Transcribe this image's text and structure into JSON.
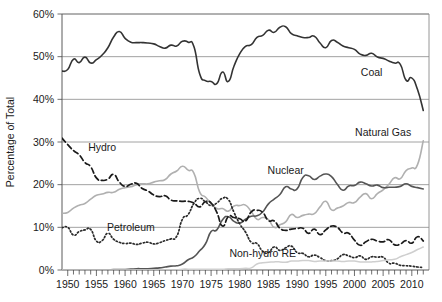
{
  "chart_data": {
    "type": "line",
    "title": "",
    "xlabel": "",
    "ylabel": "Percentage of Total",
    "xlim": [
      1949,
      2013
    ],
    "ylim": [
      0,
      60
    ],
    "grid": true,
    "legend_position": "inline-annotations",
    "ytick_labels": [
      "0%",
      "10%",
      "20%",
      "30%",
      "40%",
      "50%",
      "60%"
    ],
    "ytick_values": [
      0,
      10,
      20,
      30,
      40,
      50,
      60
    ],
    "xtick_labels": [
      "1950",
      "1955",
      "1960",
      "1965",
      "1970",
      "1975",
      "1980",
      "1985",
      "1990",
      "1995",
      "2000",
      "2005",
      "2010"
    ],
    "xtick_values": [
      1950,
      1955,
      1960,
      1965,
      1970,
      1975,
      1980,
      1985,
      1990,
      1995,
      2000,
      2005,
      2010
    ],
    "minor_tick_interval": 1,
    "x": [
      1949,
      1950,
      1951,
      1952,
      1953,
      1954,
      1955,
      1956,
      1957,
      1958,
      1959,
      1960,
      1961,
      1962,
      1963,
      1964,
      1965,
      1966,
      1967,
      1968,
      1969,
      1970,
      1971,
      1972,
      1973,
      1974,
      1975,
      1976,
      1977,
      1978,
      1979,
      1980,
      1981,
      1982,
      1983,
      1984,
      1985,
      1986,
      1987,
      1988,
      1989,
      1990,
      1991,
      1992,
      1993,
      1994,
      1995,
      1996,
      1997,
      1998,
      1999,
      2000,
      2001,
      2002,
      2003,
      2004,
      2005,
      2006,
      2007,
      2008,
      2009,
      2010,
      2011,
      2012
    ],
    "series": [
      {
        "name": "Coal",
        "style": "solid",
        "color": "#333333",
        "width": 1.6,
        "label_x": 2003,
        "label_y": 45.5,
        "values": [
          46.6,
          47.0,
          49.4,
          48.6,
          49.9,
          48.5,
          49.3,
          50.4,
          52.1,
          54.6,
          55.9,
          54.3,
          53.4,
          53.3,
          53.3,
          53.2,
          53.0,
          52.4,
          52.0,
          52.7,
          52.5,
          53.6,
          53.4,
          52.4,
          46.0,
          44.4,
          44.2,
          43.7,
          46.4,
          44.2,
          47.8,
          50.7,
          52.4,
          52.8,
          54.5,
          55.0,
          56.2,
          55.7,
          56.9,
          57.0,
          55.4,
          54.9,
          54.5,
          54.5,
          54.8,
          53.2,
          52.1,
          53.8,
          53.4,
          52.5,
          52.1,
          51.7,
          50.6,
          50.3,
          50.8,
          49.9,
          49.6,
          49.0,
          48.5,
          48.2,
          44.5,
          45.0,
          42.3,
          37.4
        ]
      },
      {
        "name": "Natural Gas",
        "style": "solid",
        "color": "#b0b0b0",
        "width": 1.6,
        "label_x": 2005,
        "label_y": 31.5,
        "values": [
          13.3,
          13.5,
          14.5,
          15.2,
          15.6,
          16.6,
          17.5,
          17.8,
          18.2,
          18.2,
          18.9,
          19.3,
          19.5,
          20.0,
          20.2,
          20.2,
          20.6,
          20.9,
          21.2,
          22.5,
          23.2,
          24.3,
          23.4,
          22.7,
          18.3,
          17.1,
          15.6,
          14.4,
          14.4,
          13.8,
          15.0,
          15.1,
          15.2,
          13.7,
          11.9,
          12.3,
          11.8,
          10.0,
          10.6,
          11.3,
          13.0,
          12.3,
          12.8,
          13.1,
          13.2,
          14.8,
          16.1,
          14.1,
          14.5,
          15.0,
          15.8,
          15.8,
          17.1,
          17.9,
          16.7,
          17.9,
          18.8,
          20.1,
          21.6,
          21.4,
          23.3,
          23.9,
          24.7,
          30.3
        ]
      },
      {
        "name": "Nuclear",
        "style": "solid",
        "color": "#555555",
        "width": 1.6,
        "label_x": 1988,
        "label_y": 22.5,
        "values": [
          0.0,
          0.0,
          0.0,
          0.0,
          0.0,
          0.0,
          0.0,
          0.0,
          0.0,
          0.1,
          0.1,
          0.1,
          0.2,
          0.3,
          0.3,
          0.3,
          0.4,
          0.5,
          0.7,
          0.9,
          1.0,
          1.4,
          2.4,
          3.1,
          4.5,
          6.1,
          9.0,
          9.4,
          11.8,
          12.5,
          11.4,
          11.0,
          11.9,
          12.6,
          12.7,
          13.6,
          15.5,
          16.6,
          17.7,
          19.5,
          19.0,
          19.0,
          21.7,
          22.1,
          21.2,
          22.0,
          22.5,
          21.9,
          20.1,
          18.7,
          19.7,
          19.8,
          20.6,
          20.2,
          19.7,
          19.9,
          19.3,
          19.4,
          19.4,
          19.6,
          20.2,
          19.6,
          19.3,
          19.0
        ]
      },
      {
        "name": "Hydro",
        "style": "dashed",
        "color": "#1a1a1a",
        "width": 1.7,
        "label_x": 1956,
        "label_y": 27.8,
        "values": [
          30.9,
          29.4,
          28.0,
          27.0,
          25.2,
          24.2,
          21.6,
          21.0,
          21.3,
          22.4,
          20.6,
          19.6,
          20.1,
          20.3,
          19.1,
          18.5,
          17.6,
          17.2,
          17.4,
          16.4,
          16.2,
          16.1,
          16.1,
          15.7,
          14.8,
          16.0,
          15.7,
          13.5,
          10.3,
          12.5,
          12.3,
          12.0,
          11.5,
          13.6,
          14.0,
          13.5,
          11.6,
          11.5,
          9.8,
          9.3,
          9.6,
          9.7,
          9.8,
          8.6,
          9.6,
          8.3,
          9.4,
          10.3,
          10.0,
          8.7,
          8.6,
          7.0,
          5.8,
          6.6,
          7.2,
          6.8,
          6.6,
          7.1,
          5.9,
          6.1,
          6.9,
          6.3,
          7.8,
          6.8
        ]
      },
      {
        "name": "Petroleum",
        "style": "dotted",
        "color": "#2a2a2a",
        "width": 1.7,
        "label_x": 1961,
        "label_y": 9.2,
        "values": [
          9.9,
          10.0,
          8.2,
          9.0,
          9.4,
          9.5,
          6.8,
          6.9,
          8.6,
          7.2,
          6.5,
          6.2,
          6.3,
          6.0,
          6.3,
          6.5,
          6.1,
          6.4,
          6.9,
          7.3,
          7.9,
          11.9,
          13.0,
          15.6,
          16.8,
          16.0,
          15.1,
          15.7,
          16.8,
          16.5,
          13.5,
          10.8,
          8.9,
          6.5,
          6.2,
          4.4,
          4.1,
          5.4,
          4.6,
          5.2,
          5.6,
          4.1,
          3.9,
          3.1,
          3.5,
          2.9,
          2.2,
          2.2,
          2.6,
          3.6,
          3.3,
          2.9,
          3.3,
          2.5,
          3.1,
          3.0,
          3.0,
          1.6,
          1.6,
          1.1,
          1.0,
          0.9,
          0.7,
          0.6
        ]
      },
      {
        "name": "Non-hydro RE",
        "style": "solid",
        "color": "#cfcfcf",
        "width": 1.5,
        "label_x": 1984,
        "label_y": 3.0,
        "values": [
          0.0,
          0.0,
          0.0,
          0.0,
          0.0,
          0.0,
          0.0,
          0.0,
          0.0,
          0.0,
          0.0,
          0.0,
          0.0,
          0.0,
          0.0,
          0.0,
          0.0,
          0.0,
          0.0,
          0.0,
          0.0,
          0.2,
          0.2,
          0.2,
          0.2,
          0.2,
          0.2,
          0.2,
          0.2,
          0.3,
          0.3,
          0.3,
          0.4,
          0.5,
          1.4,
          1.7,
          1.8,
          1.9,
          1.9,
          1.8,
          2.1,
          2.1,
          2.2,
          2.2,
          2.0,
          2.1,
          2.1,
          2.1,
          2.1,
          2.0,
          2.1,
          2.1,
          1.9,
          1.9,
          1.9,
          2.0,
          2.2,
          2.4,
          2.5,
          3.1,
          3.6,
          4.1,
          4.8,
          5.4
        ]
      }
    ]
  },
  "labels": {
    "coal": "Coal",
    "natural_gas": "Natural Gas",
    "nuclear": "Nuclear",
    "hydro": "Hydro",
    "petroleum": "Petroleum",
    "non_hydro_re": "Non-hydro RE",
    "y_axis_title": "Percentage of Total"
  }
}
